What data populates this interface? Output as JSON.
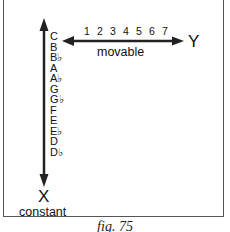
{
  "diagram": {
    "vertical_axis": {
      "notes": [
        "C",
        "B",
        "B♭",
        "A",
        "A♭",
        "G",
        "G♭",
        "F",
        "E",
        "E♭",
        "D",
        "D♭"
      ],
      "end_label": "X",
      "end_sublabel": "constant"
    },
    "horizontal_axis": {
      "numbers": [
        "1",
        "2",
        "3",
        "4",
        "5",
        "6",
        "7"
      ],
      "label": "movable",
      "end_label": "Y"
    },
    "caption": "fig. 75",
    "colors": {
      "line": "#222222",
      "frame": "#555555",
      "text": "#111111"
    }
  }
}
